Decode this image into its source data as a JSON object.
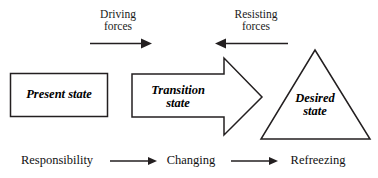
{
  "diagram": {
    "colors": {
      "stroke": "#231f20",
      "background": "#ffffff",
      "text": "#000000"
    },
    "forces": [
      {
        "id": "driving-forces",
        "line1": "Driving",
        "line2": "forces",
        "direction": "right"
      },
      {
        "id": "resisting-forces",
        "line1": "Resisting",
        "line2": "forces",
        "direction": "left"
      }
    ],
    "states": [
      {
        "id": "present-state",
        "shape": "rectangle",
        "line1": "Present state",
        "line2": ""
      },
      {
        "id": "transition-state",
        "shape": "block-arrow",
        "line1": "Transition",
        "line2": "state"
      },
      {
        "id": "desired-state",
        "shape": "triangle",
        "line1": "Desired",
        "line2": "state"
      }
    ],
    "steps": [
      {
        "id": "step-responsibility",
        "label": "Responsibility"
      },
      {
        "id": "step-changing",
        "label": "Changing"
      },
      {
        "id": "step-refreezing",
        "label": "Refreezing"
      }
    ]
  }
}
